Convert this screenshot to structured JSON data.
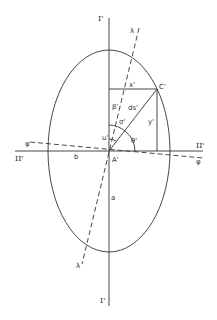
{
  "diagram": {
    "type": "geometric ellipse construction",
    "axes": {
      "vertical_top_label": "I'",
      "vertical_bottom_label": "I'",
      "horizontal_left_label": "II'",
      "horizontal_right_label": "II'"
    },
    "dashed_lines": {
      "lambda_top": "λ",
      "lambda_bottom": "λ",
      "phi_left": "φ",
      "phi_right": "φ"
    },
    "points": {
      "origin": "A'",
      "corner": "C'"
    },
    "segments": {
      "x": "x'",
      "y": "y'",
      "ds": "ds'",
      "b": "b",
      "a": "a"
    },
    "angles": {
      "beta": "β'",
      "sigma": "σ'",
      "u": "u'",
      "theta": "θ'"
    }
  }
}
